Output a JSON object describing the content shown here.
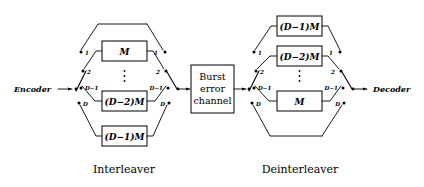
{
  "figure": {
    "background_color": "#ffffff",
    "line_color": "#000000"
  },
  "endpoints": {
    "encoder": {
      "label": "Encoder"
    },
    "decoder": {
      "label": "Decoder"
    }
  },
  "channel": {
    "name": "burst-error-channel",
    "line1": "Burst",
    "line2": "error",
    "line3": "channel"
  },
  "captions": {
    "left": "Interleaver",
    "right": "Deinterleaver"
  },
  "interleaver": {
    "name": "Interleaver",
    "branches": [
      {
        "index": 1,
        "tap": "1",
        "box": "",
        "has_box": false
      },
      {
        "index": 2,
        "tap": "2",
        "box": "M",
        "has_box": true
      },
      {
        "index": 3,
        "tap": "D−1",
        "box": "(D−2)M",
        "has_box": true
      },
      {
        "index": 4,
        "tap": "D",
        "box": "(D−1)M",
        "has_box": true
      }
    ],
    "ellipsis": "⋮",
    "box_labels": [
      "M",
      "(D−2)M",
      "(D−1)M"
    ],
    "input_tap_labels": [
      "1",
      "2",
      "D−1",
      "D"
    ],
    "output_tap_labels": [
      "1",
      "2",
      "D−1",
      "D"
    ]
  },
  "deinterleaver": {
    "name": "Deinterleaver",
    "branches": [
      {
        "index": 1,
        "tap": "1",
        "box": "(D−1)M",
        "has_box": true
      },
      {
        "index": 2,
        "tap": "2",
        "box": "(D−2)M",
        "has_box": true
      },
      {
        "index": 3,
        "tap": "D−1",
        "box": "M",
        "has_box": true
      },
      {
        "index": 4,
        "tap": "D",
        "box": "",
        "has_box": false
      }
    ],
    "ellipsis": "⋮",
    "box_labels": [
      "(D−1)M",
      "(D−2)M",
      "M"
    ],
    "input_tap_labels": [
      "1",
      "2",
      "D−1",
      "D"
    ],
    "output_tap_labels": [
      "1",
      "2",
      "D−1",
      "D"
    ]
  }
}
